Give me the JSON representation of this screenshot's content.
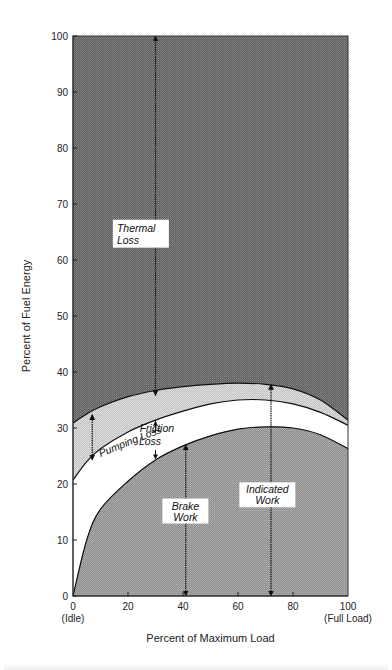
{
  "chart_data": {
    "type": "area",
    "title": "",
    "xlabel": "Percent of Maximum Load",
    "ylabel": "Percent of Fuel Energy",
    "xlim": [
      0,
      100
    ],
    "ylim": [
      0,
      100
    ],
    "grid": false,
    "x_ticks": [
      0,
      20,
      40,
      60,
      80,
      100
    ],
    "x_tick_labels": [
      "0",
      "20",
      "40",
      "60",
      "80",
      "100"
    ],
    "x_tick_sublabels": {
      "0": "(Idle)",
      "100": "(Full Load)"
    },
    "y_ticks": [
      0,
      10,
      20,
      30,
      40,
      50,
      60,
      70,
      80,
      90,
      100
    ],
    "y_tick_labels": [
      "0",
      "10",
      "20",
      "30",
      "40",
      "50",
      "60",
      "70",
      "80",
      "90",
      "100"
    ],
    "x": [
      0,
      5,
      10,
      20,
      30,
      40,
      50,
      60,
      70,
      80,
      90,
      100
    ],
    "series": [
      {
        "name": "Brake Work (upper boundary)",
        "values": [
          0,
          10,
          15.5,
          20.5,
          24.3,
          26.8,
          28.6,
          29.8,
          30.2,
          30.0,
          28.8,
          26.3
        ]
      },
      {
        "name": "Friction Loss upper boundary (Indicated minus Pumping)",
        "values": [
          20.7,
          24.0,
          26.3,
          29.3,
          31.4,
          33.0,
          34.3,
          35.0,
          35.0,
          34.3,
          32.8,
          30.5
        ]
      },
      {
        "name": "Indicated Work + Pumping Loss (upper boundary)",
        "values": [
          30.9,
          32.5,
          33.8,
          35.6,
          36.7,
          37.4,
          37.8,
          38.0,
          37.8,
          37.0,
          35.0,
          31.4
        ]
      }
    ],
    "regions": [
      {
        "name": "Thermal Loss",
        "label": [
          "Thermal",
          "Loss"
        ],
        "fill": "#6a6a6a"
      },
      {
        "name": "Pumping Loss",
        "label": [
          "Pumping Loss"
        ],
        "fill": "#cfcfcf"
      },
      {
        "name": "Friction Loss",
        "label": [
          "Friction",
          "Loss"
        ],
        "fill": "#ffffff"
      },
      {
        "name": "Brake Work",
        "label": [
          "Brake",
          "Work"
        ],
        "fill": "#9d9d9d"
      }
    ],
    "annotations": [
      {
        "text": "Thermal Loss",
        "arrow_x": 30,
        "from": 35.8,
        "to": 100
      },
      {
        "text": "Pumping Loss",
        "arrow_x": 7,
        "from": 24.3,
        "to": 32.4
      },
      {
        "text": "Friction Loss",
        "arrow_x": 30,
        "from": 24.3,
        "to": 31.4
      },
      {
        "text": "Brake Work",
        "arrow_x": 41,
        "from": 0,
        "to": 27
      },
      {
        "text": "Indicated Work",
        "arrow_x": 72,
        "from": 0,
        "to": 37.8
      }
    ]
  },
  "labels": {
    "thermal": [
      "Thermal",
      "Loss"
    ],
    "pumping": "Pumping Loss",
    "friction": [
      "Friction",
      "Loss"
    ],
    "brake": [
      "Brake",
      "Work"
    ],
    "indicated": [
      "Indicated",
      "Work"
    ],
    "x_sub_idle": "(Idle)",
    "x_sub_full": "(Full Load)"
  }
}
